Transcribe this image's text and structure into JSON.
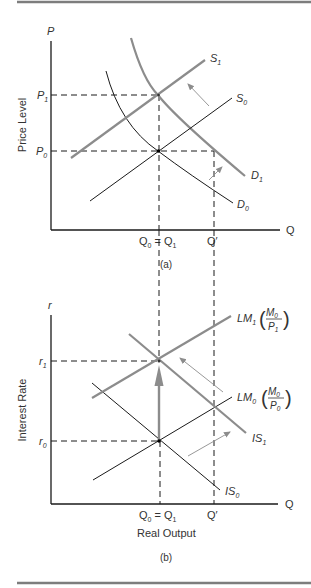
{
  "colors": {
    "rule": "#7d7d7d",
    "thin": "#1a1a1a",
    "thick": "#8c8c8c",
    "text": "#333333"
  },
  "panel_a": {
    "caption": "(a)",
    "y_axis_symbol": "P",
    "y_axis_title": "Price Level",
    "x_axis_symbol": "Q",
    "y_ticks": [
      {
        "base": "P",
        "sub": "1"
      },
      {
        "base": "P",
        "sub": "0"
      }
    ],
    "x_ticks": {
      "q0_base": "Q",
      "q0_sub": "0",
      "equals": "=",
      "q1_base": "Q",
      "q1_sub": "1",
      "qprime": "Q′"
    },
    "curves": {
      "S1": {
        "base": "S",
        "sub": "1"
      },
      "S0": {
        "base": "S",
        "sub": "0"
      },
      "D1": {
        "base": "D",
        "sub": "1"
      },
      "D0": {
        "base": "D",
        "sub": "0"
      }
    }
  },
  "panel_b": {
    "caption": "(b)",
    "y_axis_symbol": "r",
    "y_axis_title": "Interest Rate",
    "x_axis_symbol": "Q",
    "x_axis_title": "Real Output",
    "y_ticks": [
      {
        "base": "r",
        "sub": "1"
      },
      {
        "base": "r",
        "sub": "0"
      }
    ],
    "x_ticks": {
      "q0_base": "Q",
      "q0_sub": "0",
      "equals": "=",
      "q1_base": "Q",
      "q1_sub": "1",
      "qprime": "Q′"
    },
    "curves": {
      "LM1": {
        "base": "LM",
        "sub": "1",
        "num": "M",
        "num_sub": "0",
        "den": "P",
        "den_sub": "1"
      },
      "LM0": {
        "base": "LM",
        "sub": "0",
        "num": "M",
        "num_sub": "0",
        "den": "P",
        "den_sub": "0"
      },
      "IS1": {
        "base": "IS",
        "sub": "1"
      },
      "IS0": {
        "base": "IS",
        "sub": "0"
      }
    }
  }
}
